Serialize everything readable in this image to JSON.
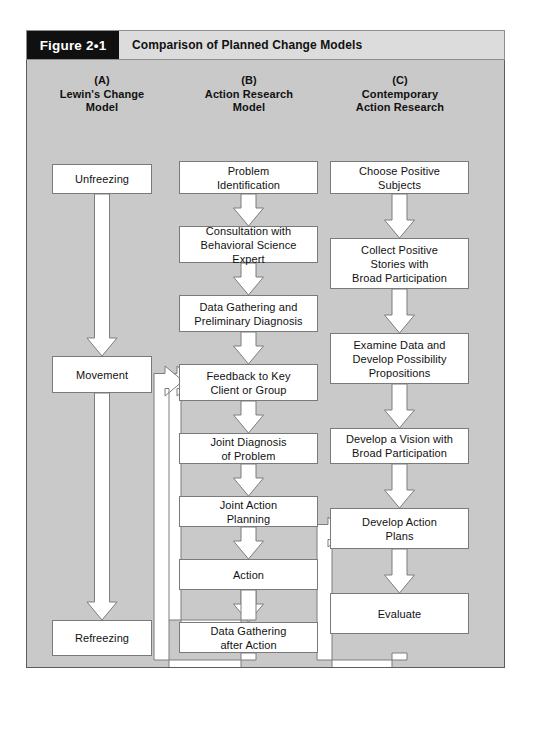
{
  "figure": {
    "label": "Figure 2•1",
    "title": "Comparison of Planned Change Models"
  },
  "columns": [
    {
      "letter": "(A)",
      "name": "Lewin's Change\nModel",
      "name_lines": [
        "Lewin's Change",
        "Model"
      ],
      "steps": [
        "Unfreezing",
        "Movement",
        "Refreezing"
      ]
    },
    {
      "letter": "(B)",
      "name": "Action Research\nModel",
      "name_lines": [
        "Action Research",
        "Model"
      ],
      "steps": [
        "Problem\nIdentification",
        "Consultation with\nBehavioral Science Expert",
        "Data Gathering and\nPreliminary Diagnosis",
        "Feedback to Key\nClient or Group",
        "Joint Diagnosis\nof Problem",
        "Joint Action\nPlanning",
        "Action",
        "Data Gathering\nafter Action"
      ],
      "feedback_loops": [
        {
          "from": "Action",
          "to": "Feedback to Key Client or Group"
        },
        {
          "from": "Data Gathering after Action",
          "to": "Feedback to Key Client or Group"
        }
      ]
    },
    {
      "letter": "(C)",
      "name": "Contemporary\nAction Research",
      "name_lines": [
        "Contemporary",
        "Action Research"
      ],
      "steps": [
        "Choose Positive\nSubjects",
        "Collect Positive\nStories with\nBroad Participation",
        "Examine Data and\nDevelop Possibility\nPropositions",
        "Develop a Vision with\nBroad Participation",
        "Develop Action\nPlans",
        "Evaluate"
      ],
      "feedback_loops": [
        {
          "from": "Evaluate",
          "to": "Develop Action Plans"
        }
      ]
    }
  ],
  "colors": {
    "panel_background": "#c9c9c9",
    "header_title_background": "#dcdcdc",
    "header_label_background": "#101010",
    "node_fill": "#ffffff",
    "node_border": "#7a7a7a",
    "arrow_fill": "#ffffff",
    "arrow_stroke": "#7d7d7d",
    "page_background": "#ffffff"
  }
}
